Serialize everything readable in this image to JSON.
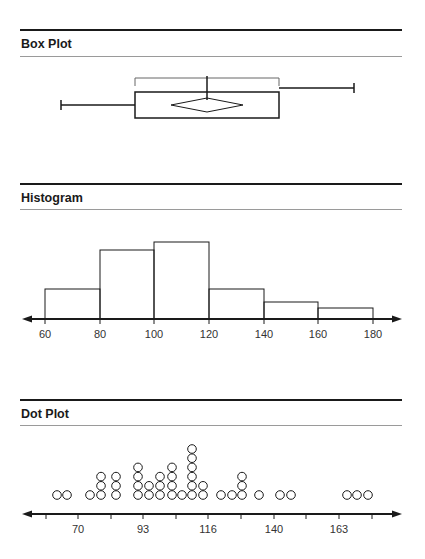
{
  "sections": {
    "box_plot": {
      "title": "Box Plot"
    },
    "histogram": {
      "title": "Histogram"
    },
    "dot_plot": {
      "title": "Dot Plot"
    }
  },
  "colors": {
    "line": "#1a1a1a",
    "rule_thin": "#9a9a9a",
    "background": "#ffffff"
  },
  "chart_data": [
    {
      "type": "box",
      "title": "Box Plot",
      "min": 64,
      "q1": 89,
      "median": 114,
      "mean": 114,
      "q3": 140,
      "max": 166,
      "notes": "Mean shown as diamond inside box; bracket above box spans Q1 to Q3; whiskers drawn at different heights"
    },
    {
      "type": "bar",
      "title": "Histogram",
      "bins": [
        [
          60,
          80
        ],
        [
          80,
          100
        ],
        [
          100,
          120
        ],
        [
          120,
          140
        ],
        [
          140,
          160
        ],
        [
          160,
          180
        ]
      ],
      "categories": [
        "60-80",
        "80-100",
        "100-120",
        "120-140",
        "140-160",
        "160-180"
      ],
      "values": [
        4,
        9,
        10,
        4,
        2,
        1.5
      ],
      "xticks": [
        60,
        80,
        100,
        120,
        140,
        160,
        180
      ],
      "xlabel": "",
      "ylabel": "",
      "notes": "Relative heights; no y-axis shown"
    },
    {
      "type": "scatter",
      "title": "Dot Plot",
      "xticks": [
        70,
        93,
        116,
        140,
        163
      ],
      "stacks": [
        {
          "x": 64,
          "count": 1
        },
        {
          "x": 67,
          "count": 1
        },
        {
          "x": 74,
          "count": 1
        },
        {
          "x": 78,
          "count": 3
        },
        {
          "x": 83,
          "count": 3
        },
        {
          "x": 91,
          "count": 4
        },
        {
          "x": 95,
          "count": 2
        },
        {
          "x": 99,
          "count": 3
        },
        {
          "x": 103,
          "count": 4
        },
        {
          "x": 107,
          "count": 1
        },
        {
          "x": 110,
          "count": 6
        },
        {
          "x": 114,
          "count": 2
        },
        {
          "x": 120,
          "count": 1
        },
        {
          "x": 124,
          "count": 1
        },
        {
          "x": 128,
          "count": 3
        },
        {
          "x": 134,
          "count": 1
        },
        {
          "x": 141,
          "count": 1
        },
        {
          "x": 145,
          "count": 1
        },
        {
          "x": 164,
          "count": 1
        },
        {
          "x": 168,
          "count": 1
        },
        {
          "x": 172,
          "count": 1
        }
      ]
    }
  ],
  "render": {
    "box": {
      "min_px": 61,
      "q1_px": 135,
      "med_px": 207,
      "q3_px": 279,
      "max_px": 354
    },
    "hist": {
      "baseline": 319,
      "ticks": [
        {
          "x": 45,
          "l": "60"
        },
        {
          "x": 100,
          "l": "80"
        },
        {
          "x": 154,
          "l": "100"
        },
        {
          "x": 209,
          "l": "120"
        },
        {
          "x": 264,
          "l": "140"
        },
        {
          "x": 318,
          "l": "160"
        },
        {
          "x": 373,
          "l": "180"
        }
      ],
      "tops": [
        289,
        250,
        242,
        289,
        302,
        308
      ]
    },
    "dots": {
      "baseline": 506,
      "major_ticks": [
        {
          "x": 78,
          "l": "70"
        },
        {
          "x": 143,
          "l": "93"
        },
        {
          "x": 208,
          "l": "116"
        },
        {
          "x": 274,
          "l": "140"
        },
        {
          "x": 339,
          "l": "163"
        }
      ],
      "minor_ticks": [
        46,
        111,
        176,
        241,
        306,
        372
      ],
      "stacks": [
        [
          57,
          1
        ],
        [
          67,
          1
        ],
        [
          90,
          1
        ],
        [
          101,
          3
        ],
        [
          116,
          3
        ],
        [
          138,
          4
        ],
        [
          149,
          2
        ],
        [
          160,
          3
        ],
        [
          172,
          4
        ],
        [
          182,
          1
        ],
        [
          192,
          6
        ],
        [
          203,
          2
        ],
        [
          221,
          1
        ],
        [
          232,
          1
        ],
        [
          242,
          3
        ],
        [
          259,
          1
        ],
        [
          280,
          1
        ],
        [
          291,
          1
        ],
        [
          347,
          1
        ],
        [
          357,
          1
        ],
        [
          368,
          1
        ]
      ]
    }
  }
}
